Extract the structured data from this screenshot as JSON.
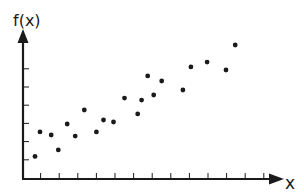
{
  "chart_data": {
    "type": "scatter",
    "title": "",
    "xlabel": "x",
    "ylabel": "f(x)",
    "grid": false,
    "legend": null,
    "x_ticks": 13,
    "y_ticks": 6,
    "tick_labels": false,
    "xlim": [
      0,
      14
    ],
    "ylim": [
      0,
      8
    ],
    "points": [
      {
        "x": 0.7,
        "y": 1.2
      },
      {
        "x": 0.97,
        "y": 2.56
      },
      {
        "x": 1.57,
        "y": 2.39
      },
      {
        "x": 1.95,
        "y": 1.56
      },
      {
        "x": 2.43,
        "y": 3.0
      },
      {
        "x": 2.86,
        "y": 2.33
      },
      {
        "x": 3.35,
        "y": 3.78
      },
      {
        "x": 4.0,
        "y": 2.56
      },
      {
        "x": 4.38,
        "y": 3.22
      },
      {
        "x": 4.92,
        "y": 3.11
      },
      {
        "x": 5.51,
        "y": 4.44
      },
      {
        "x": 6.22,
        "y": 3.56
      },
      {
        "x": 6.43,
        "y": 4.33
      },
      {
        "x": 6.76,
        "y": 5.67
      },
      {
        "x": 7.08,
        "y": 4.61
      },
      {
        "x": 7.51,
        "y": 5.39
      },
      {
        "x": 8.65,
        "y": 4.89
      },
      {
        "x": 9.08,
        "y": 6.17
      },
      {
        "x": 9.95,
        "y": 6.44
      },
      {
        "x": 10.97,
        "y": 6.0
      },
      {
        "x": 11.46,
        "y": 7.39
      }
    ]
  },
  "colors": {
    "axis": "#1a1a1a",
    "point": "#1a1a1a",
    "background": "#ffffff"
  }
}
